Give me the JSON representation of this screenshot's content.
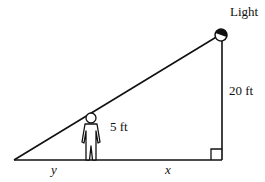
{
  "diagram": {
    "light_label": "Light",
    "pole_height_label": "20 ft",
    "person_height_label": "5 ft",
    "shadow_label": "y",
    "distance_label": "x"
  }
}
